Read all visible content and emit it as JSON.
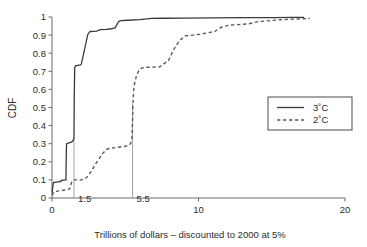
{
  "chart_data": {
    "type": "line",
    "title": "",
    "xlabel": "Trillions of dollars – discounted to 2000 at 5%",
    "ylabel": "CDF",
    "xlim": [
      0,
      20
    ],
    "ylim": [
      0,
      1
    ],
    "grid": false,
    "legend_position": "right",
    "xticks": [
      0,
      10,
      20
    ],
    "xtick_labels": [
      "0",
      "10",
      "20"
    ],
    "yticks": [
      0,
      0.1,
      0.2,
      0.3,
      0.4,
      0.5,
      0.6,
      0.7,
      0.8,
      0.9,
      1
    ],
    "ytick_labels": [
      "0",
      "0.1",
      "0.2",
      "0.3",
      "0.4",
      "0.5",
      "0.6",
      "0.7",
      "0.8",
      "0.9",
      "1"
    ],
    "annotations": [
      {
        "name": "median-3C",
        "x": 1.5,
        "label": "1.5",
        "y_top": 0.33
      },
      {
        "name": "median-2C",
        "x": 5.5,
        "label": "5.5",
        "y_top": 0.52
      }
    ],
    "series": [
      {
        "name": "3˚C",
        "style": "solid",
        "color": "#3a3a3a",
        "points": [
          [
            0.0,
            0.03
          ],
          [
            0.05,
            0.06
          ],
          [
            0.1,
            0.085
          ],
          [
            0.3,
            0.088
          ],
          [
            0.55,
            0.09
          ],
          [
            0.6,
            0.09
          ],
          [
            0.62,
            0.098
          ],
          [
            0.95,
            0.1
          ],
          [
            0.98,
            0.27
          ],
          [
            1.0,
            0.3
          ],
          [
            1.15,
            0.305
          ],
          [
            1.35,
            0.31
          ],
          [
            1.45,
            0.32
          ],
          [
            1.5,
            0.33
          ],
          [
            1.52,
            0.56
          ],
          [
            1.55,
            0.72
          ],
          [
            1.6,
            0.73
          ],
          [
            1.95,
            0.735
          ],
          [
            2.0,
            0.74
          ],
          [
            2.45,
            0.905
          ],
          [
            2.6,
            0.92
          ],
          [
            3.05,
            0.922
          ],
          [
            3.3,
            0.93
          ],
          [
            3.7,
            0.932
          ],
          [
            4.05,
            0.935
          ],
          [
            4.3,
            0.94
          ],
          [
            4.55,
            0.975
          ],
          [
            4.7,
            0.98
          ],
          [
            5.2,
            0.982
          ],
          [
            6.0,
            0.985
          ],
          [
            6.8,
            0.992
          ],
          [
            7.6,
            0.993
          ],
          [
            9.0,
            0.994
          ],
          [
            11.0,
            0.995
          ],
          [
            13.0,
            0.996
          ],
          [
            15.2,
            0.997
          ],
          [
            16.4,
            0.998
          ],
          [
            17.2,
            0.998
          ]
        ]
      },
      {
        "name": "2˚C",
        "style": "dashed",
        "color": "#5a5a5a",
        "points": [
          [
            0.0,
            0.015
          ],
          [
            0.15,
            0.035
          ],
          [
            0.55,
            0.04
          ],
          [
            0.95,
            0.045
          ],
          [
            1.2,
            0.05
          ],
          [
            1.35,
            0.09
          ],
          [
            1.5,
            0.1
          ],
          [
            1.95,
            0.1
          ],
          [
            2.2,
            0.102
          ],
          [
            2.45,
            0.12
          ],
          [
            2.7,
            0.15
          ],
          [
            2.95,
            0.185
          ],
          [
            3.2,
            0.215
          ],
          [
            3.45,
            0.245
          ],
          [
            3.7,
            0.268
          ],
          [
            3.95,
            0.275
          ],
          [
            4.3,
            0.278
          ],
          [
            4.6,
            0.282
          ],
          [
            4.95,
            0.285
          ],
          [
            5.2,
            0.29
          ],
          [
            5.35,
            0.3
          ],
          [
            5.45,
            0.32
          ],
          [
            5.5,
            0.43
          ],
          [
            5.52,
            0.52
          ],
          [
            5.6,
            0.62
          ],
          [
            5.75,
            0.67
          ],
          [
            5.9,
            0.7
          ],
          [
            6.1,
            0.718
          ],
          [
            6.45,
            0.722
          ],
          [
            6.9,
            0.723
          ],
          [
            7.35,
            0.725
          ],
          [
            7.7,
            0.745
          ],
          [
            7.95,
            0.76
          ],
          [
            8.3,
            0.82
          ],
          [
            8.7,
            0.87
          ],
          [
            9.1,
            0.895
          ],
          [
            9.6,
            0.9
          ],
          [
            10.1,
            0.905
          ],
          [
            10.6,
            0.912
          ],
          [
            11.1,
            0.92
          ],
          [
            11.6,
            0.945
          ],
          [
            12.1,
            0.955
          ],
          [
            12.7,
            0.958
          ],
          [
            13.4,
            0.962
          ],
          [
            14.1,
            0.975
          ],
          [
            14.9,
            0.98
          ],
          [
            15.6,
            0.985
          ],
          [
            16.4,
            0.988
          ],
          [
            17.1,
            0.99
          ],
          [
            17.6,
            0.992
          ]
        ]
      }
    ]
  },
  "legend": {
    "entries": [
      {
        "label": "3˚C",
        "style": "solid"
      },
      {
        "label": "2˚C",
        "style": "dashed"
      }
    ]
  }
}
